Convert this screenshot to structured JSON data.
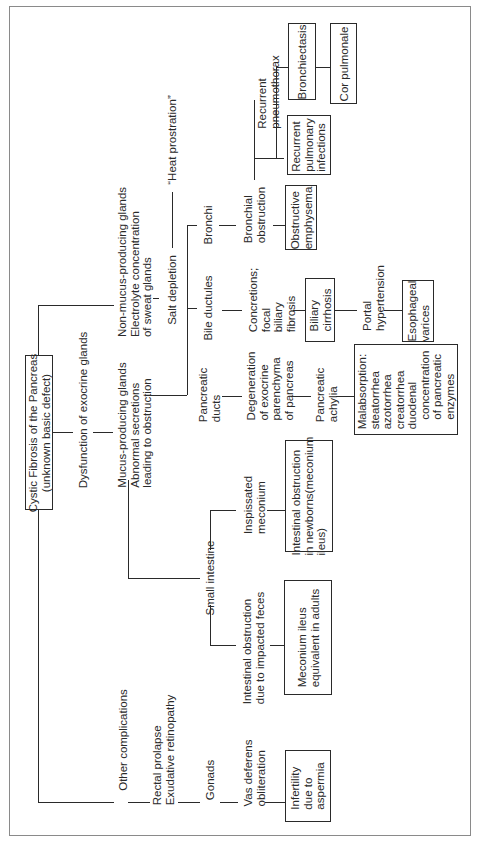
{
  "diagram": {
    "title": "Cystic Fibrosis of the Pancreas\n(unknown basic defect)",
    "orientation": "rotated 90° counter-clockwise",
    "nodes": {
      "root": "Cystic Fibrosis of the Pancreas\n(unknown basic defect)",
      "dysfunction": "Dysfunction of exocrine glands",
      "non_mucus": "Non-mucus-producing glands\nElectrolyte concentration\nof sweat glands",
      "mucus": "Mucus-producing glands\nAbnormal secretions\nleading to obstruction",
      "other": "Other complications",
      "salt": "Salt depletion",
      "heat": "“Heat prostration”",
      "bronchi": "Bronchi",
      "bile": "Bile ductules",
      "panc_ducts": "Pancreatic\nducts",
      "small_int": "Small intestine",
      "bronch_obs": "Bronchial\nobstruction",
      "recurrent_pneumo": "Recurrent\npneumothorax",
      "obstr_emph": "Obstructive\nemphysema",
      "recurrent_pulm": "Recurrent\npulmonary\ninfections",
      "bronchiectasis": "Bronchiectasis",
      "cor_pulmonale": "Cor pulmonale",
      "concretions": "Concretions;\nfocal\nbiliary\nfibrosis",
      "biliary_cirrhosis": "Biliary\ncirrhosis",
      "portal_htn": "Portal\nhypertension",
      "esoph_varices": "Esophageal\nvarices",
      "degeneration": "Degeneration\nof exocrine\nparenchyma\nof pancreas",
      "panc_achylia": "Pancreatic\nachylia",
      "malabsorption": "Malabsorption:\nsteatorrhea\nazotorrhea\ncreatorrhea\nduodenal\n   concentration\n   of pancreatic\n   enzymes",
      "inspissated": "Inspissated\nmeconium",
      "int_obs_newborn": "Intestinal obstruction\nin newborns(meconium\nileus)",
      "int_obs_feces": "Intestinal obstruction\ndue to impacted feces",
      "meconium_adults": "Meconium ileus\nequivalent in adults",
      "rectal": "Rectal prolapse\nExudative retinopathy",
      "gonads": "Gonads",
      "vas": "Vas deferens\nobliteration",
      "infertility": "Infertility\ndue to\naspermia"
    }
  }
}
